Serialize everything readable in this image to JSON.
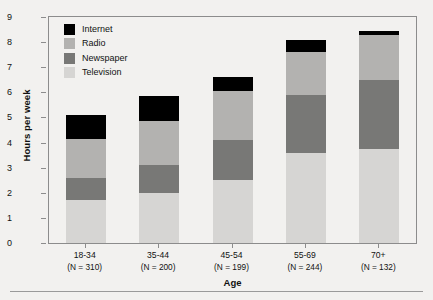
{
  "chart_data": {
    "type": "bar",
    "subtype": "stacked-bar",
    "title": "",
    "xlabel": "Age",
    "ylabel": "Hours per week",
    "ylim": [
      0,
      9
    ],
    "yticks": [
      0,
      1,
      2,
      3,
      4,
      5,
      6,
      7,
      8,
      9
    ],
    "grid": false,
    "legend_position": "top-left",
    "categories": [
      "18-34",
      "35-44",
      "45-54",
      "55-69",
      "70+"
    ],
    "category_notes": [
      "(N = 310)",
      "(N = 200)",
      "(N = 199)",
      "(N = 244)",
      "(N = 132)"
    ],
    "sample_sizes": [
      310,
      200,
      199,
      244,
      132
    ],
    "series": [
      {
        "name": "Television",
        "color": "#d6d5d3",
        "values": [
          1.7,
          2.0,
          2.5,
          3.6,
          3.75
        ]
      },
      {
        "name": "Newspaper",
        "color": "#787876",
        "values": [
          0.9,
          1.1,
          1.6,
          2.3,
          2.75
        ]
      },
      {
        "name": "Radio",
        "color": "#b3b2b0",
        "values": [
          1.55,
          1.75,
          1.95,
          1.7,
          1.8
        ]
      },
      {
        "name": "Internet",
        "color": "#000000",
        "values": [
          0.95,
          1.0,
          0.55,
          0.5,
          0.15
        ]
      }
    ],
    "stack_order_bottom_to_top": [
      "Television",
      "Newspaper",
      "Radio",
      "Internet"
    ],
    "totals": [
      5.1,
      5.85,
      6.6,
      8.1,
      8.45
    ]
  },
  "legend": {
    "items": [
      {
        "label": "Internet",
        "color": "#000000"
      },
      {
        "label": "Radio",
        "color": "#b3b2b0"
      },
      {
        "label": "Newspaper",
        "color": "#787876"
      },
      {
        "label": "Television",
        "color": "#d6d5d3"
      }
    ]
  },
  "axes": {
    "y_title": "Hours per week",
    "x_title": "Age",
    "y_tick_labels": [
      "0",
      "1",
      "2",
      "3",
      "4",
      "5",
      "6",
      "7",
      "8",
      "9"
    ],
    "x_tick_labels": [
      "18-34",
      "35-44",
      "45-54",
      "55-69",
      "70+"
    ],
    "x_tick_sublabels": [
      "(N = 310)",
      "(N = 200)",
      "(N = 199)",
      "(N = 244)",
      "(N = 132)"
    ]
  },
  "colors": {
    "frame": "#8c8c8c",
    "background": "#f2f1ef",
    "text": "#111111"
  }
}
